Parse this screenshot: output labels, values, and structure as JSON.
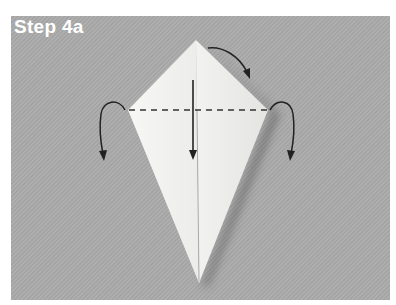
{
  "step": {
    "title": "Step 4a"
  },
  "illustration": {
    "subject": "origami kite-shaped paper fold",
    "background_color": "#a9a9a9",
    "paper_color": "#f4f4f2",
    "line_color": "#2a2a2a",
    "elements": [
      "kite-shaped folded paper",
      "horizontal dashed fold line",
      "vertical down arrow",
      "left curved arrow (fold behind)",
      "right curved arrow (fold behind)",
      "top curved arrow"
    ]
  }
}
